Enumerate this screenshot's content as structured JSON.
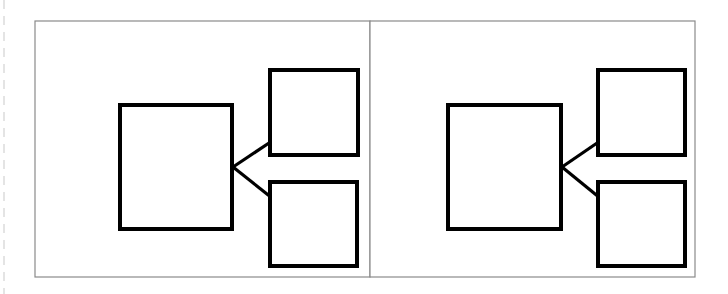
{
  "figure": {
    "canvas": {
      "width": 728,
      "height": 294
    },
    "colors": {
      "background": "#ffffff",
      "panel_border": "#8a8a8a",
      "panel_fill": "#ffffff",
      "box_stroke": "#000000",
      "box_fill": "#ffffff",
      "connector_stroke": "#000000",
      "margin_rule": "#c9c9c9"
    },
    "stroke_widths": {
      "panel_border": 1.2,
      "box_stroke": 4,
      "connector_stroke": 3.2,
      "margin_rule": 1
    }
  },
  "margin_rule": {
    "name": "left-page-margin",
    "x": 4,
    "y1": 0,
    "y2": 294,
    "dash": "9 7"
  },
  "panels": [
    {
      "id": "panel-left",
      "label": "Left panel",
      "frame": {
        "x": 35,
        "y": 21,
        "width": 335,
        "height": 256
      },
      "main_box": {
        "id": "left-main-block",
        "label": "Main block",
        "x": 120,
        "y": 105,
        "width": 112,
        "height": 124
      },
      "child_boxes": [
        {
          "id": "left-child-top",
          "label": "Top child block",
          "x": 270,
          "y": 70,
          "width": 88,
          "height": 85
        },
        {
          "id": "left-child-bottom",
          "label": "Bottom child block",
          "x": 270,
          "y": 182,
          "width": 87,
          "height": 84
        }
      ],
      "connectors": [
        {
          "id": "left-connector-top",
          "label": "Main block to top child block",
          "x1": 233,
          "y1": 167,
          "x2": 272,
          "y2": 141
        },
        {
          "id": "left-connector-bottom",
          "label": "Main block to bottom child block",
          "x1": 233,
          "y1": 167,
          "x2": 272,
          "y2": 198
        }
      ]
    },
    {
      "id": "panel-right",
      "label": "Right panel",
      "frame": {
        "x": 370,
        "y": 21,
        "width": 325,
        "height": 256
      },
      "main_box": {
        "id": "right-main-block",
        "label": "Main block",
        "x": 448,
        "y": 105,
        "width": 113,
        "height": 124
      },
      "child_boxes": [
        {
          "id": "right-child-top",
          "label": "Top child block",
          "x": 598,
          "y": 70,
          "width": 87,
          "height": 85
        },
        {
          "id": "right-child-bottom",
          "label": "Bottom child block",
          "x": 598,
          "y": 182,
          "width": 87,
          "height": 84
        }
      ],
      "connectors": [
        {
          "id": "right-connector-top",
          "label": "Main block to top child block",
          "x1": 562,
          "y1": 167,
          "x2": 600,
          "y2": 141
        },
        {
          "id": "right-connector-bottom",
          "label": "Main block to bottom child block",
          "x1": 562,
          "y1": 167,
          "x2": 600,
          "y2": 198
        }
      ]
    }
  ]
}
